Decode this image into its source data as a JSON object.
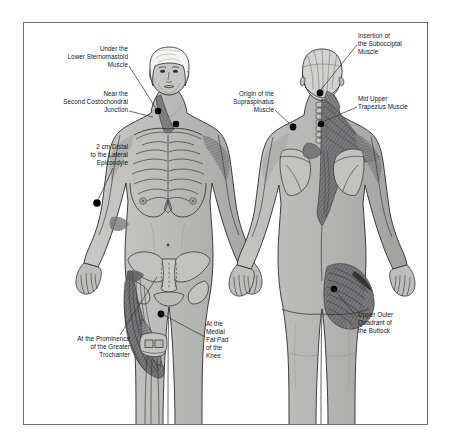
{
  "figure": {
    "title_visible": false,
    "frame": {
      "border_color": "#6d6f72",
      "background": "#ffffff"
    },
    "palette": {
      "skin": "#b9b9b7",
      "skin_light": "#cfcfcd",
      "skin_shadow": "#9a9a98",
      "muscle_dark": "#5d5d5e",
      "outline": "#2b2b2d",
      "tender_point": "#000000",
      "leader_line": "#3a3a3c",
      "hair": "#f2f2f0"
    },
    "views": [
      {
        "name": "anterior",
        "label": "Anterior (front) view of female figure"
      },
      {
        "name": "posterior",
        "label": "Posterior (back) view of female figure"
      }
    ]
  },
  "labels": [
    {
      "id": "lower-sternomastoid",
      "text": "Under the\nLower Sternomastoid\nMuscle",
      "align": "right",
      "x": 18,
      "y": 45,
      "width": 110,
      "leader": {
        "x1": 129,
        "y1": 66,
        "x2": 157,
        "y2": 110
      }
    },
    {
      "id": "second-costochondral",
      "text": "Near the\nSecond Costochondral\nJunction",
      "align": "right",
      "x": 14,
      "y": 90,
      "width": 114,
      "leader": {
        "x1": 129,
        "y1": 111,
        "x2": 153,
        "y2": 117
      }
    },
    {
      "id": "lateral-epicondyle",
      "text": "2 cm Distal\nto the Lateral\nEpicondyle",
      "align": "right",
      "x": 32,
      "y": 143,
      "width": 96,
      "leader": {
        "x1": 113,
        "y1": 168,
        "x2": 98,
        "y2": 200
      }
    },
    {
      "id": "greater-trochanter",
      "text": "At the Prominence\nof the Greater\nTrochanter",
      "align": "right",
      "x": 30,
      "y": 335,
      "width": 100,
      "leader": {
        "x1": 120,
        "y1": 335,
        "x2": 157,
        "y2": 277
      }
    },
    {
      "id": "suboccipital",
      "text": "Insertion of\nthe Subocciptal\nMuscle",
      "align": "left",
      "x": 358,
      "y": 32,
      "width": 88,
      "leader": {
        "x1": 357,
        "y1": 45,
        "x2": 319,
        "y2": 92
      }
    },
    {
      "id": "supraspinatus",
      "text": "Origin of the\nSupraspinatus\nMuscle",
      "align": "right",
      "x": 196,
      "y": 90,
      "width": 78,
      "leader": {
        "x1": 275,
        "y1": 110,
        "x2": 292,
        "y2": 126
      }
    },
    {
      "id": "mid-upper-trapezius",
      "text": "Mid Upper\nTrapezius Muscle",
      "align": "left",
      "x": 358,
      "y": 95,
      "width": 90,
      "leader": {
        "x1": 357,
        "y1": 107,
        "x2": 320,
        "y2": 123
      }
    },
    {
      "id": "medial-fat-pad-knee",
      "text": "At the\nMedial\nFat Pad\nof the\nKnee",
      "align": "left",
      "x": 206,
      "y": 320,
      "width": 54,
      "leader": {
        "x1": 205,
        "y1": 337,
        "x2": 160,
        "y2": 313
      }
    },
    {
      "id": "upper-outer-buttock",
      "text": "Upper Outer\nQuadrant of\nthe Buttock",
      "align": "left",
      "x": 358,
      "y": 311,
      "width": 78,
      "leader": {
        "x1": 357,
        "y1": 317,
        "x2": 333,
        "y2": 288
      }
    }
  ],
  "tender_points": [
    {
      "id": "tp-sternomastoid",
      "view": "anterior",
      "x": 157,
      "y": 110,
      "r": 3.3
    },
    {
      "id": "tp-costochondral",
      "view": "anterior",
      "x": 175,
      "y": 123,
      "r": 3.3
    },
    {
      "id": "tp-epicondyle",
      "view": "anterior",
      "x": 96,
      "y": 202,
      "r": 3.8
    },
    {
      "id": "tp-knee",
      "view": "anterior",
      "x": 160,
      "y": 313,
      "r": 3.4
    },
    {
      "id": "tp-suboccipital",
      "view": "posterior",
      "x": 319,
      "y": 92,
      "r": 3.4
    },
    {
      "id": "tp-trapezius",
      "view": "posterior",
      "x": 320,
      "y": 123,
      "r": 3.2
    },
    {
      "id": "tp-supraspinatus",
      "view": "posterior",
      "x": 292,
      "y": 126,
      "r": 3.4
    },
    {
      "id": "tp-buttock",
      "view": "posterior",
      "x": 333,
      "y": 288,
      "r": 3.2
    }
  ]
}
